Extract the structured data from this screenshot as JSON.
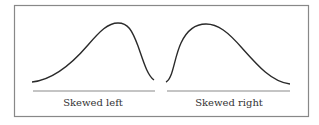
{
  "figure": {
    "border_color": "#888888",
    "curve_color": "#2a2a2a",
    "baseline_color": "#8a8a8a",
    "panels": [
      {
        "label": "Skewed left",
        "curve_path": "M32,82 C52,80 70,66 88,45 C100,31 108,23 118,23 C128,23 132,30 138,46 C143,60 147,75 154,80"
      },
      {
        "label": "Skewed right",
        "curve_path": "M166,82 C173,79 174,58 181,43 C187,30 195,24 206,24 C218,24 228,32 242,48 C258,66 272,82 290,84"
      }
    ]
  }
}
